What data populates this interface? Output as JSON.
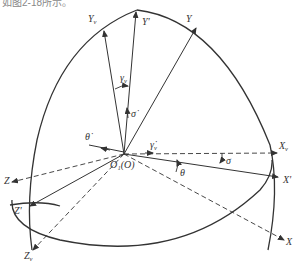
{
  "caption_fragment": "如图2-18所示。",
  "diagram": {
    "origin_label": "O₁(O)",
    "axes": [
      {
        "id": "Yv",
        "label": "Y",
        "sub": "v"
      },
      {
        "id": "Yprime",
        "label": "Y'",
        "sub": ""
      },
      {
        "id": "Y",
        "label": "Y",
        "sub": ""
      },
      {
        "id": "Xv",
        "label": "X",
        "sub": "v"
      },
      {
        "id": "Xprime",
        "label": "X'",
        "sub": ""
      },
      {
        "id": "X",
        "label": "X",
        "sub": ""
      },
      {
        "id": "Z",
        "label": "Z",
        "sub": ""
      },
      {
        "id": "Zprime",
        "label": "Z'",
        "sub": ""
      },
      {
        "id": "Zv",
        "label": "Z",
        "sub": "v"
      }
    ],
    "angles": [
      {
        "id": "gamma_v",
        "label": "γ",
        "sub": "v"
      },
      {
        "id": "sigma",
        "label": "σ"
      },
      {
        "id": "theta",
        "label": "θ"
      }
    ],
    "rates": [
      {
        "id": "sigma_dot",
        "label": "σ̇"
      },
      {
        "id": "theta_dot",
        "label": "θ̇"
      },
      {
        "id": "gamma_v_dot",
        "label": "γ̇",
        "sub": "v"
      }
    ],
    "colors": {
      "line": "#333333",
      "background": "#ffffff"
    }
  }
}
